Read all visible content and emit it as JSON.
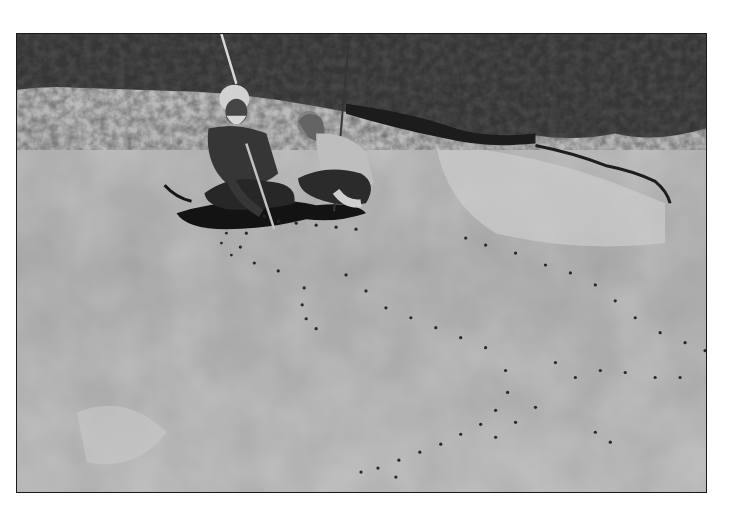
{
  "photo": {
    "kind": "black-and-white photograph",
    "subject": "Elder and young woman crouching on a sandstone rock platform beside an engraving outlined with small stones",
    "frame": {
      "left": 16,
      "top": 33,
      "width": 691,
      "height": 460,
      "border_color": "#1a1a1a"
    },
    "tones": {
      "rock_light": "#cfcfcf",
      "rock_mid": "#b3b3b3",
      "rock_dark": "#9a9a9a",
      "bush": "#3a3a3a",
      "bush_dark": "#1e1e1e",
      "shadow": "#151515",
      "stone": "#2a2a2a",
      "skin": "#4a4a4a",
      "hair_white": "#dedede"
    },
    "elements": [
      {
        "name": "bushland-background",
        "desc": "dense scrub along the top edge"
      },
      {
        "name": "rock-crack",
        "desc": "dark fissure running across upper right"
      },
      {
        "name": "elder-figure",
        "desc": "bearded man crouching, holding a stick, pointing at rock"
      },
      {
        "name": "girl-figure",
        "desc": "young woman crouching, holding a long stick"
      },
      {
        "name": "engraving-outline-stones",
        "desc": "rows of small dark stones marking carved outlines"
      }
    ]
  }
}
